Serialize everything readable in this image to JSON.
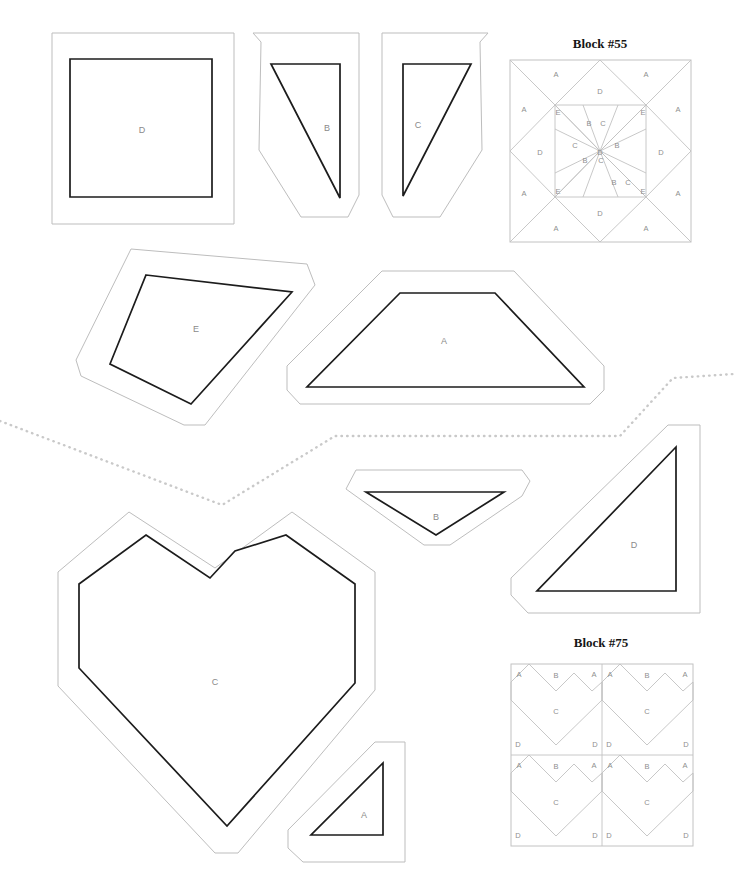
{
  "sheet": {
    "width": 734,
    "height": 882,
    "background": "#ffffff",
    "cut_line_color": "#1c1c1c",
    "seam_line_color": "#bdbdbd",
    "label_color": "#8a8a8a",
    "divider_color": "#c9c9c9"
  },
  "divider": {
    "name": "page-division-dotted-line",
    "points": "0,421 222,505 335,436 620,436 673,378 734,374"
  },
  "sections": [
    {
      "id": "block-55",
      "title": "Block #55",
      "title_x": 600,
      "title_y": 48,
      "diagram": {
        "x": 510,
        "y": 60,
        "size": 181,
        "labels": [
          {
            "text": "A",
            "x": 556,
            "y": 75
          },
          {
            "text": "A",
            "x": 646,
            "y": 75
          },
          {
            "text": "A",
            "x": 524,
            "y": 110
          },
          {
            "text": "A",
            "x": 678,
            "y": 110
          },
          {
            "text": "A",
            "x": 524,
            "y": 194
          },
          {
            "text": "A",
            "x": 678,
            "y": 194
          },
          {
            "text": "A",
            "x": 556,
            "y": 229
          },
          {
            "text": "A",
            "x": 646,
            "y": 229
          },
          {
            "text": "B",
            "x": 589,
            "y": 124
          },
          {
            "text": "B",
            "x": 616,
            "y": 146
          },
          {
            "text": "B",
            "x": 586,
            "y": 161
          },
          {
            "text": "B",
            "x": 613,
            "y": 183
          },
          {
            "text": "C",
            "x": 603,
            "y": 124
          },
          {
            "text": "C",
            "x": 576,
            "y": 146
          },
          {
            "text": "C",
            "x": 600,
            "y": 161
          },
          {
            "text": "C",
            "x": 627,
            "y": 183
          },
          {
            "text": "D",
            "x": 600,
            "y": 92
          },
          {
            "text": "D",
            "x": 600,
            "y": 153
          },
          {
            "text": "D",
            "x": 600,
            "y": 214
          },
          {
            "text": "D",
            "x": 540,
            "y": 153
          },
          {
            "text": "D",
            "x": 661,
            "y": 153
          },
          {
            "text": "E",
            "x": 558,
            "y": 113
          },
          {
            "text": "E",
            "x": 643,
            "y": 113
          },
          {
            "text": "E",
            "x": 558,
            "y": 192
          },
          {
            "text": "E",
            "x": 643,
            "y": 192
          }
        ]
      },
      "templates": [
        {
          "letter": "D",
          "name": "template-piece-d-square",
          "label_x": 142,
          "label_y": 131,
          "cut": "70,59 212,59 212,197 70,197",
          "seam": "52,33 234,33 234,224 52,224"
        },
        {
          "letter": "B",
          "name": "template-piece-b-triangle",
          "label_x": 327,
          "label_y": 129,
          "cut": "271,64 340,64 340,198",
          "seam": "261,42 253,33 359,33 359,195 348,217 301,217 259,150"
        },
        {
          "letter": "C",
          "name": "template-piece-c-triangle",
          "label_x": 418,
          "label_y": 126,
          "cut": "403,64 471,64 403,196"
        },
        {
          "letter": "E",
          "name": "template-piece-e-quadrilateral",
          "label_x": 196,
          "label_y": 330,
          "cut": "146,275 292,292 191,404 110,364",
          "seam": "131,249 307,264 315,285 205,425 184,425 81,376 76,360"
        },
        {
          "letter": "A",
          "name": "template-piece-a-trapezoid",
          "label_x": 444,
          "label_y": 342,
          "cut": "400,293 495,293 584,387 307,387",
          "seam": "382,271 514,271 604,366 604,390 590,404 300,404 287,390 287,366"
        }
      ]
    },
    {
      "id": "block-75",
      "title": "Block #75",
      "title_x": 601,
      "title_y": 647,
      "diagram": {
        "x": 511,
        "y": 664,
        "size": 182,
        "unit_labels": [
          "A",
          "B",
          "A",
          "C",
          "D",
          "D"
        ]
      },
      "templates": [
        {
          "letter": "C",
          "name": "template-piece-c-heart",
          "label_x": 215,
          "label_y": 683,
          "cut": "146,535 210,578 235,551 286,535 355,584 355,683 227,826 79,668 79,584",
          "seam": "129,512 215,568 292,512 375,572 375,690 238,853 215,853 58,686 58,572"
        },
        {
          "letter": "B",
          "name": "template-piece-b-inverted-triangle",
          "label_x": 436,
          "label_y": 518,
          "cut": "366,492 504,492 436,535",
          "seam": "356,470 522,470 530,481 522,496 450,545 424,545 346,489"
        },
        {
          "letter": "D",
          "name": "template-piece-d-right-triangle",
          "label_x": 634,
          "label_y": 546,
          "cut": "676,447 676,591 537,591",
          "seam": "668,425 700,425 700,613 528,613 511,595 511,578"
        },
        {
          "letter": "A",
          "name": "template-piece-a-right-triangle",
          "label_x": 364,
          "label_y": 816,
          "cut": "383,763 383,835 311,835"
        }
      ]
    }
  ]
}
